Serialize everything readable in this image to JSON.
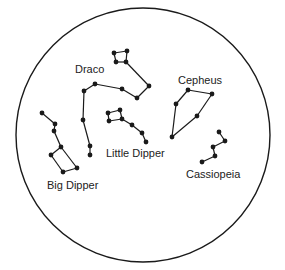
{
  "colors": {
    "ink": "#1a1a1a",
    "background": "#ffffff"
  },
  "constellations": [
    {
      "name": "Draco",
      "stars": [
        [
          114,
          53
        ],
        [
          127,
          51
        ],
        [
          126,
          62
        ],
        [
          116,
          62
        ],
        [
          149,
          86
        ],
        [
          137,
          98
        ],
        [
          122,
          89
        ],
        [
          95,
          84
        ],
        [
          84,
          91
        ],
        [
          83,
          120
        ],
        [
          90,
          146
        ],
        [
          90,
          155
        ]
      ],
      "lines": [
        [
          0,
          1
        ],
        [
          1,
          2
        ],
        [
          2,
          3
        ],
        [
          3,
          0
        ],
        [
          2,
          4
        ],
        [
          4,
          5
        ],
        [
          5,
          6
        ],
        [
          6,
          7
        ],
        [
          7,
          8
        ],
        [
          8,
          9
        ],
        [
          9,
          10
        ],
        [
          10,
          11
        ]
      ]
    },
    {
      "name": "Little Dipper",
      "stars": [
        [
          108,
          113
        ],
        [
          120,
          110
        ],
        [
          122,
          119
        ],
        [
          109,
          121
        ],
        [
          132,
          125
        ],
        [
          142,
          133
        ],
        [
          146,
          142
        ]
      ],
      "lines": [
        [
          0,
          1
        ],
        [
          1,
          2
        ],
        [
          2,
          3
        ],
        [
          3,
          0
        ],
        [
          2,
          4
        ],
        [
          4,
          5
        ],
        [
          5,
          6
        ]
      ]
    },
    {
      "name": "Big Dipper",
      "stars": [
        [
          42,
          113
        ],
        [
          55,
          124
        ],
        [
          54,
          131
        ],
        [
          61,
          147
        ],
        [
          51,
          155
        ],
        [
          63,
          172
        ],
        [
          77,
          168
        ]
      ],
      "lines": [
        [
          0,
          1
        ],
        [
          1,
          2
        ],
        [
          2,
          3
        ],
        [
          3,
          4
        ],
        [
          4,
          5
        ],
        [
          5,
          6
        ],
        [
          6,
          3
        ]
      ]
    },
    {
      "name": "Cepheus",
      "stars": [
        [
          188,
          90
        ],
        [
          212,
          94
        ],
        [
          197,
          116
        ],
        [
          172,
          137
        ],
        [
          176,
          104
        ]
      ],
      "lines": [
        [
          0,
          1
        ],
        [
          1,
          2
        ],
        [
          2,
          3
        ],
        [
          3,
          4
        ],
        [
          4,
          0
        ]
      ]
    },
    {
      "name": "Cassiopeia",
      "stars": [
        [
          219,
          132
        ],
        [
          225,
          141
        ],
        [
          213,
          147
        ],
        [
          215,
          156
        ],
        [
          202,
          162
        ]
      ],
      "lines": [
        [
          0,
          1
        ],
        [
          1,
          2
        ],
        [
          2,
          3
        ],
        [
          3,
          4
        ]
      ]
    }
  ],
  "labels": {
    "draco": "Draco",
    "cepheus": "Cepheus",
    "little_dipper": "Little Dipper",
    "big_dipper": "Big Dipper",
    "cassiopeia": "Cassiopeia"
  }
}
